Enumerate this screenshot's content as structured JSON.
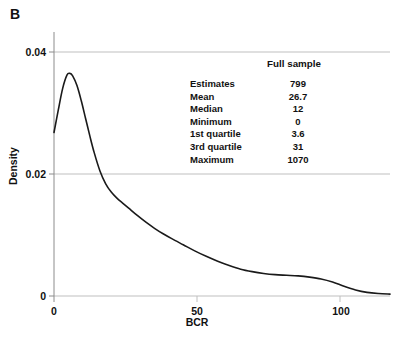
{
  "figure": {
    "panel_letter": "B"
  },
  "chart_data": {
    "type": "line",
    "title": "",
    "xlabel": "BCR",
    "ylabel": "Density",
    "xlim": [
      0,
      117
    ],
    "ylim": [
      0,
      0.0455
    ],
    "grid": true,
    "grid_lines": [
      0.02,
      0.04
    ],
    "legend": "none",
    "xticks": [
      0,
      50,
      100
    ],
    "xtick_labels": [
      "0",
      "50",
      "100"
    ],
    "yticks": [
      0,
      0.02,
      0.04
    ],
    "ytick_labels": [
      "0",
      "0.02",
      "0.04"
    ],
    "series": [
      {
        "name": "Density of BCR",
        "x": [
          0,
          1.5,
          3,
          4.5,
          5.5,
          6.5,
          8,
          9.5,
          11,
          12.5,
          14,
          16,
          18,
          20,
          22,
          24,
          26,
          29,
          32,
          35,
          38,
          41,
          45,
          49,
          53,
          57,
          61,
          65,
          69,
          73,
          77,
          81,
          85,
          89,
          93,
          97,
          101,
          105,
          109,
          113,
          117
        ],
        "y": [
          0.0268,
          0.0305,
          0.034,
          0.0362,
          0.0365,
          0.0361,
          0.0345,
          0.032,
          0.0291,
          0.0262,
          0.0235,
          0.0205,
          0.0184,
          0.017,
          0.016,
          0.0152,
          0.0144,
          0.0132,
          0.0121,
          0.0111,
          0.0102,
          0.0094,
          0.0084,
          0.0074,
          0.0065,
          0.0057,
          0.005,
          0.0044,
          0.004,
          0.0037,
          0.0035,
          0.0034,
          0.0033,
          0.0031,
          0.0028,
          0.0023,
          0.0016,
          0.001,
          0.0006,
          0.0004,
          0.0003
        ]
      }
    ]
  },
  "stats": {
    "header": "Full sample",
    "rows": [
      {
        "label": "Estimates",
        "value": "799"
      },
      {
        "label": "Mean",
        "value": "26.7"
      },
      {
        "label": "Median",
        "value": "12"
      },
      {
        "label": "Minimum",
        "value": "0"
      },
      {
        "label": "1st quartile",
        "value": "3.6"
      },
      {
        "label": "3rd quartile",
        "value": "31"
      },
      {
        "label": "Maximum",
        "value": "1070"
      }
    ]
  },
  "colors": {
    "curve": "#1a1a1a",
    "axis": "#8c8c8c",
    "grid": "#bfbfbf",
    "text": "#111111",
    "background": "#ffffff"
  }
}
